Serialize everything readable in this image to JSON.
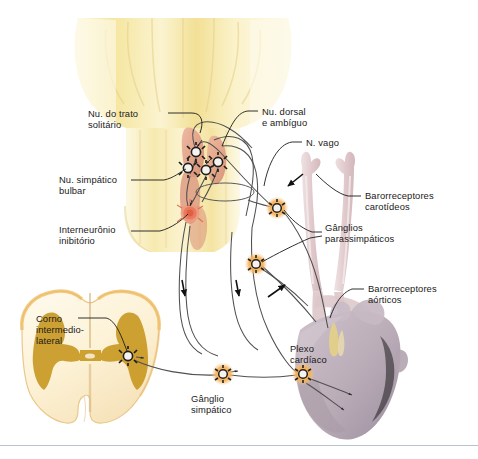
{
  "figure": {
    "language": "pt-BR",
    "background_color": "#ffffff",
    "baseline_rule_color": "#b9c2d4"
  },
  "labels": [
    {
      "id": "nu-trato-solitario",
      "text": "Nu. do trato\nsolitário",
      "x": 88,
      "y": 108,
      "align": "left"
    },
    {
      "id": "nu-dorsal-ambiguo",
      "text": "Nu. dorsal\ne ambíguo",
      "x": 262,
      "y": 106,
      "align": "left"
    },
    {
      "id": "n-vago",
      "text": "N. vago",
      "x": 306,
      "y": 137,
      "align": "left"
    },
    {
      "id": "nu-simpatico-bulbar",
      "text": "Nu. simpático\nbulbar",
      "x": 59,
      "y": 174,
      "align": "left"
    },
    {
      "id": "interneuronio-inibitorio",
      "text": "Interneurônio\ninibitório",
      "x": 59,
      "y": 224,
      "align": "left"
    },
    {
      "id": "barorreceptores-carotideos",
      "text": "Barorreceptores\ncarotídeos",
      "x": 365,
      "y": 190,
      "align": "left"
    },
    {
      "id": "ganglios-parassimpaticos",
      "text": "Gânglios\nparassimpáticos",
      "x": 325,
      "y": 222,
      "align": "left"
    },
    {
      "id": "barorreceptores-aorticos",
      "text": "Barorreceptores\naórticos",
      "x": 368,
      "y": 283,
      "align": "left"
    },
    {
      "id": "corno-intermediolateral",
      "text": "Corno\nintermedio-\nlateral",
      "x": 36,
      "y": 313,
      "align": "left"
    },
    {
      "id": "plexo-cardiaco",
      "text": "Plexo\ncardíaco",
      "x": 290,
      "y": 343,
      "align": "left"
    },
    {
      "id": "ganglio-simpatico",
      "text": "Gânglio\nsimpático",
      "x": 191,
      "y": 393,
      "align": "left"
    }
  ],
  "colors": {
    "brainstem_yellow": "#f7e9a8",
    "brainstem_yellow_light": "#fcf6d8",
    "brainstem_shadow": "#e8d489",
    "nucleus_salmon": "#e8a890",
    "nucleus_salmon_dark": "#d98a72",
    "interneuron_red": "#e8745c",
    "ganglion_orange": "#f4a742",
    "ganglion_orange_light": "#f9c57c",
    "neuron_body": "#f2f2ee",
    "neuron_outline": "#2a2a2a",
    "spinal_white_matter": "#fdf3dd",
    "spinal_gray_matter": "#c99a28",
    "spinal_rim": "#e8b860",
    "artery_pink": "#e6d2d4",
    "artery_pink_dark": "#d8bcc0",
    "heart_mauve": "#bfb0bb",
    "heart_mauve_dark": "#a396a1",
    "nerve_line": "#4a4a4a",
    "leader_line": "#1a1a1a",
    "arrow_black": "#111111"
  },
  "structures": [
    {
      "id": "medulla-oblongata",
      "name": "Bulbo / tronco encefálico",
      "color_key": "brainstem_yellow"
    },
    {
      "id": "nucleus-tractus-solitarius",
      "name": "Núcleo do trato solitário",
      "color_key": "nucleus_salmon"
    },
    {
      "id": "dorsal-nucleus-ambiguus",
      "name": "Núcleo dorsal do vago e núcleo ambíguo",
      "color_key": "nucleus_salmon"
    },
    {
      "id": "bulbar-sympathetic-nucleus",
      "name": "Núcleo simpático bulbar",
      "color_key": "nucleus_salmon_dark"
    },
    {
      "id": "inhibitory-interneuron",
      "name": "Interneurônio inibitório",
      "color_key": "interneuron_red"
    },
    {
      "id": "spinal-cord-section",
      "name": "Corte transversal da medula espinal",
      "color_key": "spinal_gray_matter"
    },
    {
      "id": "carotid-arteries",
      "name": "Artérias carótidas",
      "color_key": "artery_pink"
    },
    {
      "id": "heart",
      "name": "Coração",
      "color_key": "heart_mauve"
    },
    {
      "id": "vagus-nerve",
      "name": "Nervo vago",
      "color_key": "nerve_line"
    }
  ],
  "ganglia_markers": [
    {
      "id": "neuron-nts",
      "cx": 196,
      "cy": 152,
      "r": 6.5,
      "halo": false,
      "region": "brainstem"
    },
    {
      "id": "neuron-ambiguus",
      "cx": 218,
      "cy": 162,
      "r": 6.5,
      "halo": false,
      "region": "brainstem"
    },
    {
      "id": "neuron-sympathetic-bulb",
      "cx": 190,
      "cy": 168,
      "r": 6.5,
      "halo": false,
      "region": "brainstem"
    },
    {
      "id": "neuron-sympathetic-2",
      "cx": 206,
      "cy": 170,
      "r": 6.5,
      "halo": false,
      "region": "brainstem"
    },
    {
      "id": "ganglion-carotid-para",
      "cx": 277,
      "cy": 208,
      "r": 6.2,
      "halo": true,
      "region": "neck"
    },
    {
      "id": "ganglion-aortic-para",
      "cx": 256,
      "cy": 264,
      "r": 6.2,
      "halo": true,
      "region": "thorax"
    },
    {
      "id": "neuron-intermediolateral",
      "cx": 128,
      "cy": 356,
      "r": 6.2,
      "halo": false,
      "region": "spinal-cord"
    },
    {
      "id": "ganglion-sympathetic",
      "cx": 223,
      "cy": 374,
      "r": 6.2,
      "halo": true,
      "region": "paravertebral"
    },
    {
      "id": "ganglion-cardiac-plexus",
      "cx": 303,
      "cy": 374,
      "r": 6.2,
      "halo": true,
      "region": "heart"
    }
  ],
  "flow_arrows": [
    {
      "id": "arrow-descending-left",
      "x": 183,
      "y": 288,
      "direction": "down"
    },
    {
      "id": "arrow-descending-right",
      "x": 237,
      "y": 288,
      "direction": "down"
    },
    {
      "id": "arrow-afferent-carotid",
      "x": 292,
      "y": 183,
      "direction": "up-left"
    },
    {
      "id": "arrow-afferent-aortic",
      "x": 280,
      "y": 290,
      "direction": "up-right"
    }
  ]
}
